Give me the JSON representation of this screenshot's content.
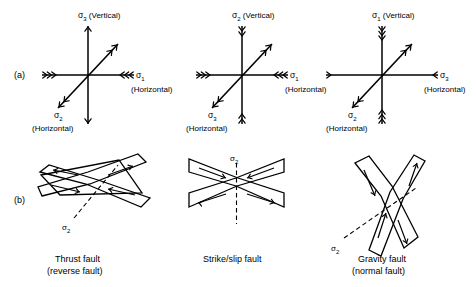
{
  "figure": {
    "type": "geology-stress-fault-diagram",
    "row_labels": {
      "a": "(a)",
      "b": "(b)"
    },
    "symbols": {
      "sigma": "σ",
      "s1": "1",
      "s2": "2",
      "s3": "3",
      "vertical": "(Vertical)",
      "horizontal": "(Horizontal)"
    },
    "stress_diagrams": [
      {
        "name": "thrust-stress-axes",
        "vertical_axis": {
          "label_sub": "3",
          "orientation": "(Vertical)",
          "arrowheads": 1,
          "direction": "outward"
        },
        "horizontal_axis": {
          "label_sub": "1",
          "orientation": "(Horizontal)",
          "arrowheads": 3,
          "direction": "inward"
        },
        "diagonal_axis": {
          "label_sub": "2",
          "orientation": "(Horizontal)",
          "arrowheads": 2,
          "direction": "outward"
        }
      },
      {
        "name": "strikeslip-stress-axes",
        "vertical_axis": {
          "label_sub": "2",
          "orientation": "(Vertical)",
          "arrowheads": 2,
          "direction": "inward"
        },
        "horizontal_axis": {
          "label_sub": "1",
          "orientation": "(Horizontal)",
          "arrowheads": 3,
          "direction": "inward"
        },
        "diagonal_axis": {
          "label_sub": "3",
          "orientation": "(Horizontal)",
          "arrowheads": 2,
          "direction": "outward"
        }
      },
      {
        "name": "gravity-stress-axes",
        "vertical_axis": {
          "label_sub": "1",
          "orientation": "(Vertical)",
          "arrowheads": 3,
          "direction": "inward"
        },
        "horizontal_axis": {
          "label_sub": "3",
          "orientation": "(Horizontal)",
          "arrowheads": 1,
          "direction": "inward"
        },
        "diagonal_axis": {
          "label_sub": "2",
          "orientation": "(Horizontal)",
          "arrowheads": 2,
          "direction": "outward"
        }
      }
    ],
    "fault_diagrams": [
      {
        "name": "thrust-fault",
        "caption_line1": "Thrust fault",
        "caption_line2": "(reverse fault)",
        "sigma2_sub": "2",
        "sigma2_trace": "inclined-dashed"
      },
      {
        "name": "strike-slip-fault",
        "caption_line1": "Strike/slip fault",
        "caption_line2": "",
        "sigma2_sub": "2",
        "sigma2_trace": "vertical-dashed"
      },
      {
        "name": "gravity-fault",
        "caption_line1": "Gravity fault",
        "caption_line2": "(normal fault)",
        "sigma2_sub": "2",
        "sigma2_trace": "inclined-dashed"
      }
    ]
  },
  "colors": {
    "ink": "#000000",
    "background": "#ffffff"
  }
}
